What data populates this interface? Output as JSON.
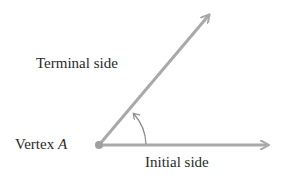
{
  "diagram": {
    "type": "angle-in-standard-position",
    "labels": {
      "terminal_side": "Terminal side",
      "initial_side": "Initial side",
      "vertex_prefix": "Vertex ",
      "vertex_letter": "A"
    },
    "colors": {
      "ray": "#a9a9a9",
      "arc": "#8a8a8a",
      "text": "#2a2a2a",
      "background": "#ffffff"
    },
    "geometry": {
      "vertex": [
        99,
        145
      ],
      "initial_side_end": [
        270,
        145
      ],
      "terminal_side_end": [
        210,
        13
      ],
      "arc_direction": "counterclockwise"
    }
  }
}
